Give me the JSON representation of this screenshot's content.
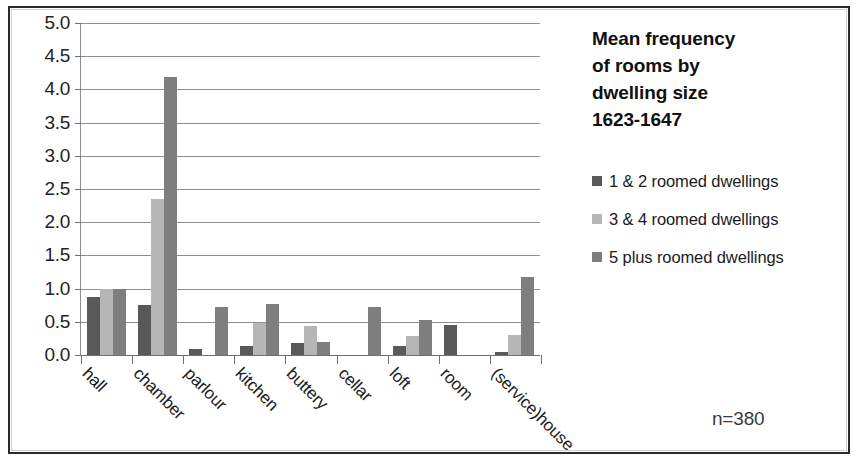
{
  "figure": {
    "sample_size_label": "n=380"
  },
  "chart_data": {
    "type": "bar",
    "title_lines": [
      "Mean frequency",
      "of rooms by",
      "dwelling size",
      "1623-1647"
    ],
    "xlabel": "",
    "ylabel": "",
    "ylim": [
      0,
      5
    ],
    "ytick_step": 0.5,
    "ytick_labels": [
      "5.0",
      "4.5",
      "4.0",
      "3.5",
      "3.0",
      "2.5",
      "2.0",
      "1.5",
      "1.0",
      "0.5",
      "0.0"
    ],
    "ytick_values": [
      5.0,
      4.5,
      4.0,
      3.5,
      3.0,
      2.5,
      2.0,
      1.5,
      1.0,
      0.5,
      0.0
    ],
    "grid": true,
    "legend_position": "right",
    "categories": [
      "hall",
      "chamber",
      "parlour",
      "kitchen",
      "buttery",
      "cellar",
      "loft",
      "room",
      "(service)house"
    ],
    "series": [
      {
        "name": "1 & 2 roomed dwellings",
        "color": "#595959",
        "values": [
          0.87,
          0.75,
          0.09,
          0.13,
          0.18,
          0.0,
          0.13,
          0.45,
          0.04
        ]
      },
      {
        "name": "3 & 4 roomed dwellings",
        "color": "#b6b6b6",
        "values": [
          1.0,
          2.35,
          0.0,
          0.48,
          0.43,
          0.0,
          0.28,
          0.0,
          0.3
        ]
      },
      {
        "name": "5 plus roomed dwellings",
        "color": "#7e7e7e",
        "values": [
          1.0,
          4.18,
          0.72,
          0.77,
          0.2,
          0.72,
          0.52,
          0.0,
          1.17
        ]
      }
    ],
    "annotations": [
      "n=380"
    ]
  }
}
